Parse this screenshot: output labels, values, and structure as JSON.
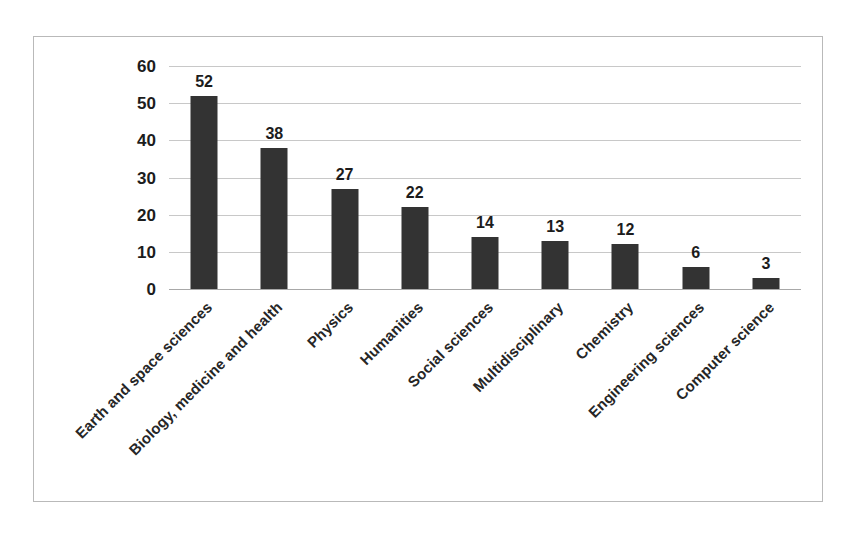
{
  "chart_data": {
    "type": "bar",
    "title": "",
    "subtitle": "",
    "xlabel": "",
    "ylabel": "",
    "categories": [
      "Earth and space sciences",
      "Biology, medicine and health",
      "Physics",
      "Humanities",
      "Social sciences",
      "Multidisciplinary",
      "Chemistry",
      "Engineering sciences",
      "Computer science"
    ],
    "values": [
      52,
      38,
      27,
      22,
      14,
      13,
      12,
      6,
      3
    ],
    "data_labels": [
      "52",
      "38",
      "27",
      "22",
      "14",
      "13",
      "12",
      "6",
      "3"
    ],
    "ylim": [
      0,
      60
    ],
    "yticks": [
      0,
      10,
      20,
      30,
      40,
      50,
      60
    ],
    "ytick_labels": [
      "0",
      "10",
      "20",
      "30",
      "40",
      "50",
      "60"
    ],
    "grid": true,
    "grid_axis": "y",
    "legend": "none",
    "bar_color": "#333333",
    "gridline_color": "#c8c8c8",
    "background_color": "#ffffff",
    "border_color": "#b9b9b9",
    "label_rotation_deg": -45
  }
}
